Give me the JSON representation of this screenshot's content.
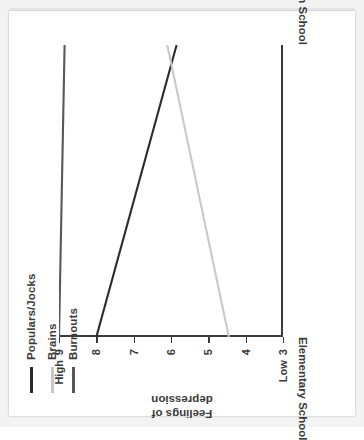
{
  "chart_data": {
    "type": "line",
    "title": "",
    "subtitle": "",
    "xlabel": "",
    "ylabel": "Feelings of depression",
    "ylabel_line1": "Feelings of",
    "ylabel_line2": "depression",
    "orientation": "rotated-90-ccw",
    "grid": false,
    "legend_position": "top-left",
    "x": [
      "Elementary School",
      "High School"
    ],
    "categories": [
      "Elementary School",
      "High School"
    ],
    "xtick_labels": [
      "Elementary School",
      "High School"
    ],
    "ylim": [
      3,
      9
    ],
    "y_axis_direction": "9 (High) at top, 3 (Low) at bottom",
    "ytick_values": [
      9,
      8,
      7,
      6,
      5,
      4,
      3
    ],
    "ytick_labels": [
      "9",
      "8",
      "7",
      "6",
      "5",
      "4",
      "3"
    ],
    "y_high_endcap": "High",
    "y_low_endcap": "Low",
    "series": [
      {
        "name": "Populars/Jocks",
        "color": "#2b2b2b",
        "values": [
          8.0,
          5.85
        ]
      },
      {
        "name": "Brains",
        "color": "#c9c9c9",
        "values": [
          4.45,
          6.1
        ]
      },
      {
        "name": "Burnouts",
        "color": "#585858",
        "values": [
          9.0,
          8.85
        ]
      }
    ]
  },
  "legend": {
    "items": [
      {
        "label": "Populars/Jocks",
        "color": "#2b2b2b"
      },
      {
        "label": "Brains",
        "color": "#c9c9c9"
      },
      {
        "label": "Burnouts",
        "color": "#585858"
      }
    ]
  },
  "axis": {
    "y_title_line1": "Feelings of",
    "y_title_line2": "depression",
    "ticks": [
      {
        "label": "9",
        "endcap": "High"
      },
      {
        "label": "8",
        "endcap": ""
      },
      {
        "label": "7",
        "endcap": ""
      },
      {
        "label": "6",
        "endcap": ""
      },
      {
        "label": "5",
        "endcap": ""
      },
      {
        "label": "4",
        "endcap": ""
      },
      {
        "label": "3",
        "endcap": "Low"
      }
    ],
    "category_left": "Elementary School",
    "category_right": "High School"
  },
  "colors": {
    "axis": "#3c3c3c",
    "text": "#3a3a3a",
    "paper": "#ffffff",
    "backdrop": "#f3f3f3"
  }
}
